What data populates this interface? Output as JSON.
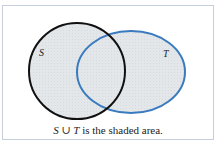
{
  "diagram": {
    "type": "venn",
    "sets": [
      {
        "label": "S",
        "stroke": "#111111",
        "shape": "circle"
      },
      {
        "label": "T",
        "stroke": "#3a7bbf",
        "shape": "ellipse"
      }
    ],
    "shading": {
      "region": "union",
      "fill": "#e4e7ea"
    },
    "frame_border": "#c5cfdb"
  },
  "caption": {
    "set_a": "S",
    "operator": "∪",
    "set_b": "T",
    "rest": "is the shaded area."
  }
}
